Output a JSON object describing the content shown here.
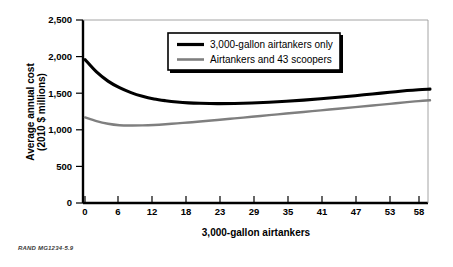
{
  "figure": {
    "credit": "RAND MG1234-5.9",
    "background_color": "#ffffff"
  },
  "chart_data": {
    "type": "line",
    "title": "",
    "xlabel": "3,000-gallon airtankers",
    "ylabel": "Average annual cost (2010 $ millions)",
    "ylabel_line1": "Average annual cost",
    "ylabel_line2": "(2010 $ millions)",
    "xtick_labels": [
      "0",
      "6",
      "12",
      "18",
      "23",
      "29",
      "35",
      "41",
      "47",
      "53",
      "58"
    ],
    "xtick_values": [
      0,
      6,
      12,
      18,
      23,
      29,
      35,
      41,
      47,
      53,
      58
    ],
    "ytick_labels": [
      "0",
      "500",
      "1,000",
      "1,500",
      "2,000",
      "2,500"
    ],
    "ytick_values": [
      0,
      500,
      1000,
      1500,
      2000,
      2500
    ],
    "ylim": [
      0,
      2500
    ],
    "xlim": [
      0,
      60
    ],
    "grid": false,
    "legend_position": "top-center",
    "x": [
      0,
      2,
      4,
      6,
      8,
      10,
      12,
      14,
      16,
      18,
      20,
      23,
      26,
      29,
      32,
      35,
      38,
      41,
      44,
      47,
      50,
      53,
      56,
      58,
      60
    ],
    "series": [
      {
        "name": "3,000-gallon airtankers only",
        "color": "#000000",
        "line_width": 3.1,
        "values": [
          1960,
          1790,
          1665,
          1575,
          1508,
          1458,
          1422,
          1398,
          1380,
          1368,
          1362,
          1358,
          1360,
          1366,
          1376,
          1390,
          1406,
          1424,
          1444,
          1466,
          1490,
          1512,
          1536,
          1548,
          1556
        ]
      },
      {
        "name": "Airtankers and 43 scoopers",
        "color": "#7f7f7f",
        "line_width": 2.4,
        "values": [
          1170,
          1118,
          1082,
          1062,
          1058,
          1060,
          1066,
          1076,
          1088,
          1100,
          1113,
          1134,
          1156,
          1178,
          1200,
          1222,
          1244,
          1266,
          1288,
          1310,
          1332,
          1354,
          1378,
          1392,
          1404
        ]
      }
    ]
  },
  "legend": {
    "items": [
      {
        "label": "3,000-gallon airtankers only",
        "color": "#000000",
        "swatch": "thick-line-swatch"
      },
      {
        "label": "Airtankers and 43 scoopers",
        "color": "#7f7f7f",
        "swatch": "medium-line-swatch"
      }
    ]
  }
}
